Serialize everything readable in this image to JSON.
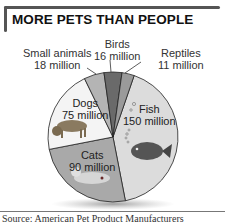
{
  "title": "MORE PETS THAN PEOPLE",
  "source_text": "Source: American Pet Product Manufacturers",
  "chart_data": {
    "type": "pie",
    "title": "MORE PETS THAN PEOPLE",
    "unit": "million",
    "slices": [
      {
        "name": "Fish",
        "value": 150,
        "label": "150 million",
        "color": "#dcdcdc"
      },
      {
        "name": "Cats",
        "value": 90,
        "label": "90 million",
        "color": "#a9a9a9"
      },
      {
        "name": "Dogs",
        "value": 75,
        "label": "75 million",
        "color": "#f4f4f4"
      },
      {
        "name": "Small animals",
        "value": 18,
        "label": "18 million",
        "color": "#b4b4b4"
      },
      {
        "name": "Birds",
        "value": 16,
        "label": "16 million",
        "color": "#6a6a6a"
      },
      {
        "name": "Reptiles",
        "value": 11,
        "label": "11 million",
        "color": "#9a9a9a"
      }
    ],
    "legend": "none (direct labels)"
  },
  "labels": {
    "birds": {
      "name": "Birds",
      "value": "16 million"
    },
    "reptiles": {
      "name": "Reptiles",
      "value": "11 million"
    },
    "small_animals": {
      "name": "Small animals",
      "value": "18 million"
    },
    "dogs": {
      "name": "Dogs",
      "value": "75 million"
    },
    "fish": {
      "name": "Fish",
      "value": "150 million"
    },
    "cats": {
      "name": "Cats",
      "value": "90 million"
    }
  }
}
